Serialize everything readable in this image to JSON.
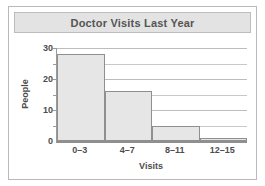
{
  "figure": {
    "title": "Doctor Visits Last Year",
    "border_color": "#b9b9b9",
    "title_band_color": "#e3e3e3"
  },
  "chart_data": {
    "type": "bar",
    "title": "Doctor Visits Last Year",
    "categories": [
      "0–3",
      "4–7",
      "8–11",
      "12–15"
    ],
    "values": [
      28,
      16,
      5,
      1
    ],
    "xlabel": "Visits",
    "ylabel": "People",
    "ylim": [
      0,
      30
    ],
    "yticks": [
      0,
      10,
      20,
      30
    ],
    "ytick_labels": [
      "0",
      "10",
      "20",
      "30"
    ],
    "minor_gridlines": [
      5,
      15,
      25
    ],
    "grid": true,
    "legend": null,
    "bar_fill_color": "#e6e6e6",
    "bar_edge_color": "#8f8f8f",
    "axis_color": "#8f8f8f",
    "grid_color": "#c8c8c8",
    "text_color": "#4d4d4d"
  }
}
